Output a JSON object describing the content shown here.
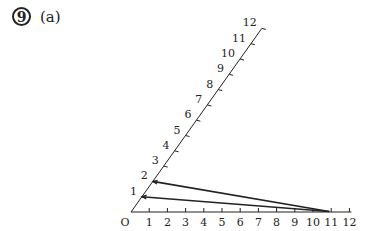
{
  "question": {
    "number": "9",
    "part": "(a)"
  },
  "diagram": {
    "origin_label": "O",
    "horizontal_axis": {
      "ticks": [
        "1",
        "2",
        "3",
        "4",
        "5",
        "6",
        "7",
        "8",
        "9",
        "10",
        "11",
        "12"
      ]
    },
    "slanted_axis": {
      "ticks": [
        "1",
        "2",
        "3",
        "4",
        "5",
        "6",
        "7",
        "8",
        "9",
        "10",
        "11",
        "12"
      ]
    },
    "joining_lines": [
      {
        "from_slant_unit": 1,
        "to_horizontal_unit": 11
      },
      {
        "from_slant_unit": 2,
        "to_horizontal_unit": 11
      }
    ],
    "line_color": "#222222"
  }
}
